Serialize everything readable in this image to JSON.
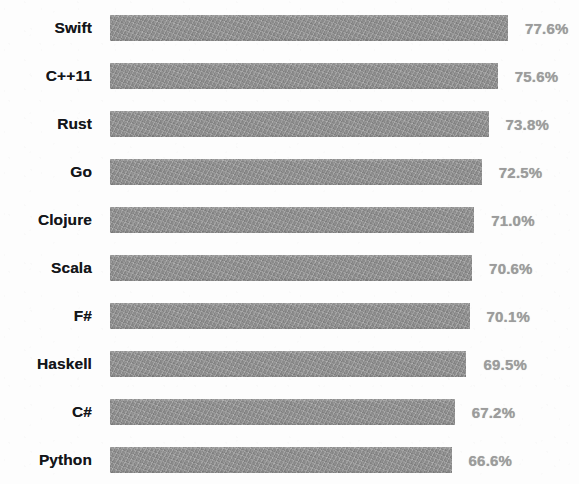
{
  "chart_data": {
    "type": "bar",
    "orientation": "horizontal",
    "title": "",
    "subtitle": "",
    "xlabel": "",
    "ylabel": "",
    "grid": false,
    "legend": null,
    "xlim": [
      0,
      100
    ],
    "value_suffix": "%",
    "categories": [
      "Swift",
      "C++11",
      "Rust",
      "Go",
      "Clojure",
      "Scala",
      "F#",
      "Haskell",
      "C#",
      "Python"
    ],
    "values": [
      77.6,
      75.6,
      73.8,
      72.5,
      71.0,
      70.6,
      70.1,
      69.5,
      67.2,
      66.6
    ],
    "value_labels": [
      "77.6%",
      "75.6%",
      "73.8%",
      "72.5%",
      "71.0%",
      "70.6%",
      "70.1%",
      "69.5%",
      "67.2%",
      "66.6%"
    ],
    "bar_color": "#8b8b8b",
    "label_color": "#14161a",
    "value_label_color": "#9c9c9c",
    "background_color": "#fdfdfd",
    "note": "last row (Python) is clipped by the bottom edge of the image"
  },
  "rows": [
    {
      "label": "Swift",
      "value_label": "77.6%",
      "value": 77.6
    },
    {
      "label": "C++11",
      "value_label": "75.6%",
      "value": 75.6
    },
    {
      "label": "Rust",
      "value_label": "73.8%",
      "value": 73.8
    },
    {
      "label": "Go",
      "value_label": "72.5%",
      "value": 72.5
    },
    {
      "label": "Clojure",
      "value_label": "71.0%",
      "value": 71.0
    },
    {
      "label": "Scala",
      "value_label": "70.6%",
      "value": 70.6
    },
    {
      "label": "F#",
      "value_label": "70.1%",
      "value": 70.1
    },
    {
      "label": "Haskell",
      "value_label": "69.5%",
      "value": 69.5
    },
    {
      "label": "C#",
      "value_label": "67.2%",
      "value": 67.2
    },
    {
      "label": "Python",
      "value_label": "66.6%",
      "value": 66.6
    }
  ]
}
